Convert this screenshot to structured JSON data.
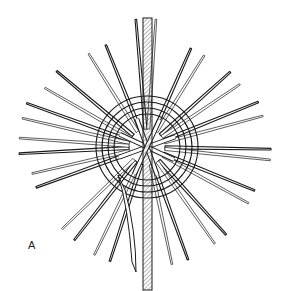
{
  "figure": {
    "label": "A",
    "center": [
      147,
      147
    ],
    "ring_radii": [
      36,
      48
    ],
    "stroke_color": "#1a1a1a",
    "hatch_color": "#555555",
    "background": "#ffffff",
    "spokes": [
      {
        "angle": -95,
        "inner": 18,
        "outer": 128
      },
      {
        "angle": -86,
        "inner": 18,
        "outer": 128
      },
      {
        "angle": -112,
        "inner": 18,
        "outer": 110
      },
      {
        "angle": -122,
        "inner": 18,
        "outer": 110
      },
      {
        "angle": -66,
        "inner": 18,
        "outer": 108
      },
      {
        "angle": -58,
        "inner": 18,
        "outer": 108
      },
      {
        "angle": -140,
        "inner": 18,
        "outer": 118
      },
      {
        "angle": -150,
        "inner": 18,
        "outer": 118
      },
      {
        "angle": -42,
        "inner": 18,
        "outer": 112
      },
      {
        "angle": -34,
        "inner": 18,
        "outer": 112
      },
      {
        "angle": -160,
        "inner": 18,
        "outer": 128
      },
      {
        "angle": -167,
        "inner": 18,
        "outer": 128
      },
      {
        "angle": -22,
        "inner": 18,
        "outer": 120
      },
      {
        "angle": -15,
        "inner": 18,
        "outer": 120
      },
      {
        "angle": 177,
        "inner": 18,
        "outer": 128
      },
      {
        "angle": 184,
        "inner": 18,
        "outer": 128
      },
      {
        "angle": 1,
        "inner": 18,
        "outer": 124
      },
      {
        "angle": 6,
        "inner": 18,
        "outer": 124
      },
      {
        "angle": 160,
        "inner": 18,
        "outer": 118
      },
      {
        "angle": 167,
        "inner": 18,
        "outer": 118
      },
      {
        "angle": 22,
        "inner": 18,
        "outer": 116
      },
      {
        "angle": 29,
        "inner": 18,
        "outer": 116
      },
      {
        "angle": 128,
        "inner": 18,
        "outer": 118
      },
      {
        "angle": 136,
        "inner": 18,
        "outer": 118
      },
      {
        "angle": 48,
        "inner": 18,
        "outer": 118
      },
      {
        "angle": 55,
        "inner": 18,
        "outer": 118
      },
      {
        "angle": 108,
        "inner": 18,
        "outer": 120
      },
      {
        "angle": 116,
        "inner": 18,
        "outer": 120
      },
      {
        "angle": 70,
        "inner": 18,
        "outer": 120
      },
      {
        "angle": 78,
        "inner": 18,
        "outer": 120
      }
    ]
  }
}
